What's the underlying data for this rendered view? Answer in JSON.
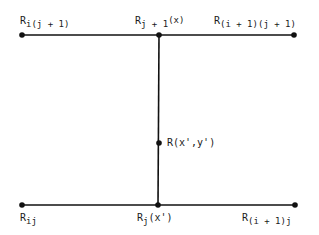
{
  "diagram": {
    "colors": {
      "line": "#111111",
      "text": "#1a1a1a",
      "background": "#ffffff"
    },
    "nodes": [
      {
        "id": "top-left",
        "x": 22,
        "y": 35,
        "label_main": "R",
        "label_sub": "i(j + 1)",
        "label_sup": ""
      },
      {
        "id": "top-middle",
        "x": 159,
        "y": 35,
        "label_main": "R",
        "label_sub": "j + 1",
        "label_sup": "(x)"
      },
      {
        "id": "top-right",
        "x": 294,
        "y": 35,
        "label_main": "R",
        "label_sub": "(i + 1)(j + 1)",
        "label_sup": ""
      },
      {
        "id": "middle",
        "x": 159,
        "y": 143,
        "label_main": "R(x',y')",
        "label_sub": "",
        "label_sup": ""
      },
      {
        "id": "bottom-left",
        "x": 22,
        "y": 205,
        "label_main": "R",
        "label_sub": "ij",
        "label_sup": ""
      },
      {
        "id": "bottom-middle",
        "x": 158,
        "y": 205,
        "label_main": "R",
        "label_sub": "j",
        "label_sup": "(x')"
      },
      {
        "id": "bottom-right",
        "x": 295,
        "y": 205,
        "label_main": "R",
        "label_sub": "(i + 1)j",
        "label_sup": ""
      }
    ],
    "edges": [
      {
        "from": "top-left",
        "to": "top-right"
      },
      {
        "from": "bottom-left",
        "to": "bottom-right"
      },
      {
        "from": "top-middle",
        "to": "bottom-middle"
      }
    ]
  }
}
